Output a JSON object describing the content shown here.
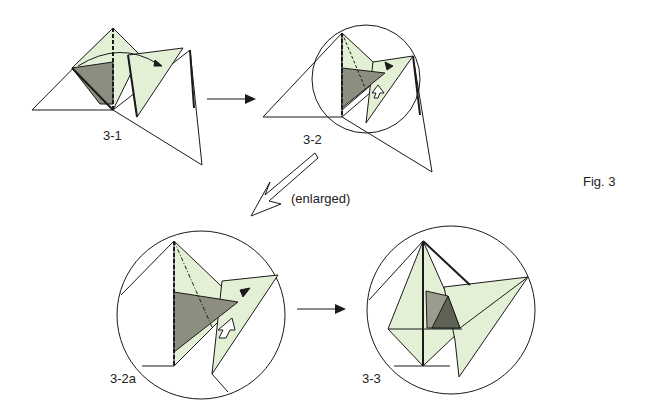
{
  "figure": {
    "title": "Fig. 3",
    "steps": [
      {
        "id": "3-1",
        "label": "3-1"
      },
      {
        "id": "3-2",
        "label": "3-2"
      },
      {
        "id": "3-2a",
        "label": "3-2a"
      },
      {
        "id": "3-3",
        "label": "3-3"
      }
    ],
    "annotation": "(enlarged)",
    "colors": {
      "light_fill": "#e3f0d6",
      "dark_fill": "#8c8f80",
      "line": "#1a1a1a"
    }
  }
}
